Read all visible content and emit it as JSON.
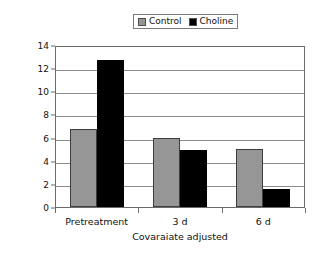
{
  "chart_data": {
    "type": "bar",
    "title": "",
    "xlabel": "Covaraiate adjusted",
    "ylabel": "Liver TAG, ug/ug DNA",
    "categories": [
      "Pretreatment",
      "3 d",
      "6 d"
    ],
    "series": [
      {
        "name": "Control",
        "color": "#969696",
        "values": [
          6.7,
          6.0,
          5.0
        ]
      },
      {
        "name": "Choline",
        "color": "#000000",
        "values": [
          12.7,
          4.9,
          1.55
        ]
      }
    ],
    "ylim": [
      0,
      14
    ],
    "yticks": [
      0,
      2,
      4,
      6,
      8,
      10,
      12,
      14
    ],
    "ytick_labels": [
      "0",
      "2",
      "4",
      "6",
      "8",
      "10",
      "12",
      "14"
    ],
    "grid": "horizontal",
    "legend_position": "top-center"
  },
  "legend": {
    "entries": [
      {
        "label": "Control",
        "swatch": "gray-square-icon"
      },
      {
        "label": "Choline",
        "swatch": "black-square-icon"
      }
    ]
  },
  "axes": {
    "y_title": "Liver TAG, ug/ug DNA",
    "x_title": "Covaraiate adjusted"
  }
}
